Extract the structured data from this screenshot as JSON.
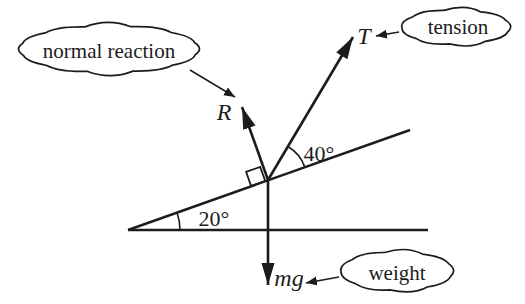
{
  "diagram": {
    "colors": {
      "ink": "#1c1c1c",
      "background": "#ffffff"
    },
    "callouts": {
      "normal_reaction": "normal reaction",
      "tension": "tension",
      "weight": "weight"
    },
    "force_labels": {
      "normal": "R",
      "tension": "T",
      "weight": "mg"
    },
    "angle_labels": {
      "incline": "20°",
      "tension_to_incline": "40°"
    }
  }
}
